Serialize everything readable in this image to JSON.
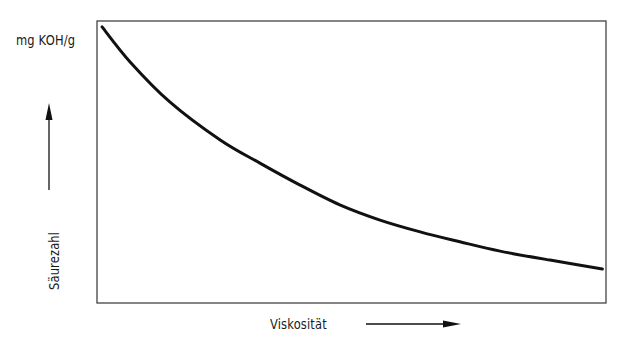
{
  "chart_data": {
    "type": "line",
    "title": "",
    "xlabel": "Viskosität",
    "ylabel": "Säurezahl",
    "y_unit": "mg KOH/g",
    "grid": false,
    "legend": null,
    "axis_ticks": false,
    "axis_arrows": {
      "x": "right",
      "y": "up"
    },
    "note": "Qualitative curve, no numeric ticks; values normalized 0-1 (x: fraction of axis width, y: fraction of axis height)",
    "xlim": [
      0,
      1
    ],
    "ylim": [
      0,
      1
    ],
    "series": [
      {
        "name": "Säurezahl vs. Viskosität",
        "x": [
          0.01,
          0.065,
          0.143,
          0.242,
          0.32,
          0.399,
          0.477,
          0.556,
          0.635,
          0.713,
          0.792,
          0.89,
          0.993
        ],
        "y": [
          0.979,
          0.855,
          0.713,
          0.578,
          0.496,
          0.418,
          0.348,
          0.294,
          0.252,
          0.217,
          0.184,
          0.152,
          0.121
        ]
      }
    ]
  },
  "labels": {
    "unit": "mg KOH/g",
    "x_axis": "Viskosität",
    "y_axis": "Säurezahl"
  },
  "plot_box": {
    "left": 97,
    "top": 21,
    "right": 606,
    "bottom": 303
  }
}
